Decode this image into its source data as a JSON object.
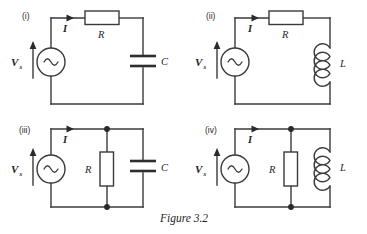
{
  "figure": {
    "caption": "Figure 3.2",
    "caption_x": 160,
    "caption_y": 222
  },
  "labels": {
    "source": "V",
    "source_subscript": "s",
    "current": "I",
    "resistor": "R",
    "capacitor": "C",
    "inductor": "L"
  },
  "colors": {
    "wire": "#3a3a3a",
    "node": "#2a2a2a",
    "text": "#1f1f1f",
    "background": "#ffffff",
    "component_fill": "#ffffff"
  },
  "circuits": [
    {
      "id": "circuit-i",
      "roman": "(i)",
      "roman_x": 22,
      "roman_y": 19,
      "topology": "series",
      "source_type": "ac-voltage-source",
      "components": [
        "resistor-horizontal",
        "capacitor-vertical"
      ],
      "source_label": "V",
      "source_sublabel": "s",
      "current_label": "I",
      "series_element_label": "R",
      "shunt_element_label": "C",
      "shunt_element_type": "capacitor"
    },
    {
      "id": "circuit-ii",
      "roman": "(ii)",
      "roman_x": 206,
      "roman_y": 19,
      "topology": "series",
      "source_type": "ac-voltage-source",
      "components": [
        "resistor-horizontal",
        "inductor-vertical"
      ],
      "source_label": "V",
      "source_sublabel": "s",
      "current_label": "I",
      "series_element_label": "R",
      "shunt_element_label": "L",
      "shunt_element_type": "inductor"
    },
    {
      "id": "circuit-iii",
      "roman": "(iii)",
      "roman_x": 19,
      "roman_y": 133,
      "topology": "parallel",
      "source_type": "ac-voltage-source",
      "components": [
        "resistor-vertical",
        "capacitor-vertical"
      ],
      "source_label": "V",
      "source_sublabel": "s",
      "current_label": "I",
      "series_element_label": "R",
      "shunt_element_label": "C",
      "shunt_element_type": "capacitor"
    },
    {
      "id": "circuit-iv",
      "roman": "(iv)",
      "roman_x": 205,
      "roman_y": 133,
      "topology": "parallel",
      "source_type": "ac-voltage-source",
      "components": [
        "resistor-vertical",
        "inductor-vertical"
      ],
      "source_label": "V",
      "source_sublabel": "s",
      "current_label": "I",
      "series_element_label": "R",
      "shunt_element_label": "L",
      "shunt_element_type": "inductor"
    }
  ]
}
